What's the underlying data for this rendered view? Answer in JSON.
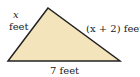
{
  "figure": {
    "shape": "triangle",
    "fill_color": "#f4e4bb",
    "stroke_color": "#222222",
    "labels": {
      "left_var": "x",
      "left_unit": "feet",
      "right_side": "(x + 2) feet",
      "bottom_side": "7 feet"
    }
  }
}
